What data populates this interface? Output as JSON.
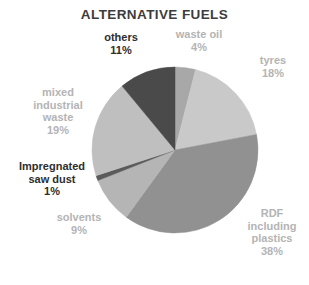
{
  "chart_data": {
    "type": "pie",
    "title": "ALTERNATIVE FUELS",
    "xlabel": "",
    "ylabel": "",
    "legend_position": "none",
    "grid": false,
    "labels_outside": true,
    "unit": "%",
    "categories": [
      "waste oil",
      "tyres",
      "RDF including plastics",
      "solvents",
      "Impregnated saw dust",
      "mixed industrial waste",
      "others"
    ],
    "values": [
      4,
      18,
      38,
      9,
      1,
      19,
      11
    ],
    "colors": [
      "#a8a8a8",
      "#c9c9c9",
      "#919191",
      "#b5b5b5",
      "#5a5a5a",
      "#bfbfbf",
      "#4a4a4a"
    ],
    "slices": [
      {
        "name": "waste oil",
        "value": 4,
        "value_label": "4%",
        "label_text": "waste oil",
        "color": "#a8a8a8",
        "label_style": "muted"
      },
      {
        "name": "tyres",
        "value": 18,
        "value_label": "18%",
        "label_text": "tyres",
        "color": "#c9c9c9",
        "label_style": "muted"
      },
      {
        "name": "RDF including plastics",
        "value": 38,
        "value_label": "38%",
        "label_line1": "RDF",
        "label_line2": "including",
        "label_line3": "plastics",
        "color": "#919191",
        "label_style": "muted"
      },
      {
        "name": "solvents",
        "value": 9,
        "value_label": "9%",
        "label_text": "solvents",
        "color": "#b5b5b5",
        "label_style": "muted"
      },
      {
        "name": "Impregnated saw dust",
        "value": 1,
        "value_label": "1%",
        "label_line1": "Impregnated",
        "label_line2": "saw dust",
        "color": "#5a5a5a",
        "label_style": "dark"
      },
      {
        "name": "mixed industrial waste",
        "value": 19,
        "value_label": "19%",
        "label_line1": "mixed",
        "label_line2": "industrial",
        "label_line3": "waste",
        "color": "#bfbfbf",
        "label_style": "muted"
      },
      {
        "name": "others",
        "value": 11,
        "value_label": "11%",
        "label_text": "others",
        "color": "#4a4a4a",
        "label_style": "dark"
      }
    ],
    "geometry": {
      "center_x": 175,
      "center_y": 150,
      "radius": 83,
      "start_angle_deg": 0
    }
  }
}
